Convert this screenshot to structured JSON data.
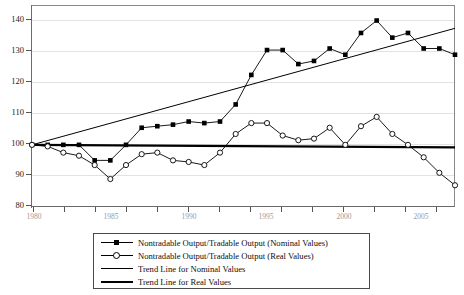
{
  "chart_data": {
    "type": "line",
    "title": "",
    "xlabel": "",
    "ylabel": "",
    "xlim": [
      1980,
      2007
    ],
    "ylim": [
      80,
      145
    ],
    "ytick_labels": [
      "80",
      "90",
      "100",
      "110",
      "120",
      "130",
      "140"
    ],
    "ytick_values": [
      80,
      90,
      100,
      110,
      120,
      130,
      140
    ],
    "xtick_labels": [
      "1980",
      "1985",
      "1990",
      "1995",
      "2000",
      "2005"
    ],
    "xtick_values": [
      1980,
      1985,
      1990,
      1995,
      2000,
      2005
    ],
    "grid": true,
    "legend_position": "below-center",
    "x": [
      1980,
      1981,
      1982,
      1983,
      1984,
      1985,
      1986,
      1987,
      1988,
      1989,
      1990,
      1991,
      1992,
      1993,
      1994,
      1995,
      1996,
      1997,
      1998,
      1999,
      2000,
      2001,
      2002,
      2003,
      2004,
      2005,
      2006,
      2007
    ],
    "series": [
      {
        "name": "Nontradable Output/Tradable Output (Nominal Values)",
        "marker": "filled-square",
        "color": "#000000",
        "values": [
          100,
          100,
          100,
          100,
          95,
          95,
          100,
          105.5,
          106,
          106.5,
          107.5,
          107,
          107.5,
          113,
          122.5,
          130.5,
          130.5,
          126,
          127,
          131,
          129,
          136,
          140,
          134.5,
          136,
          131,
          131,
          129
        ]
      },
      {
        "name": "Nontradable Output/Tradable Output (Real Values)",
        "marker": "open-circle",
        "color": "#000000",
        "values": [
          100,
          99.5,
          97.5,
          96.5,
          93.5,
          89,
          93.5,
          97,
          97.5,
          95,
          94.5,
          93.5,
          97.5,
          103.5,
          107,
          107,
          103,
          101.5,
          102,
          105.5,
          100,
          106,
          109,
          103.5,
          100,
          96,
          91,
          87
        ]
      },
      {
        "name": "Trend Line for Nominal Values",
        "marker": "none",
        "style": "thin",
        "color": "#000000",
        "endpoints": [
          [
            1980,
            100
          ],
          [
            2007,
            137.5
          ]
        ]
      },
      {
        "name": "Trend Line for Real Values",
        "marker": "none",
        "style": "thick",
        "color": "#000000",
        "endpoints": [
          [
            1980,
            100
          ],
          [
            2007,
            99.2
          ]
        ]
      }
    ],
    "legend": [
      {
        "label": "Nontradable Output/Tradable Output (Nominal Values)",
        "key": "line-filled-square"
      },
      {
        "label": "Nontradable Output/Tradable Output (Real Values)",
        "key": "line-open-circle"
      },
      {
        "label": "Trend Line for Nominal Values",
        "key": "line-thin"
      },
      {
        "label": "Trend Line for Real Values",
        "key": "line-thick"
      }
    ]
  }
}
